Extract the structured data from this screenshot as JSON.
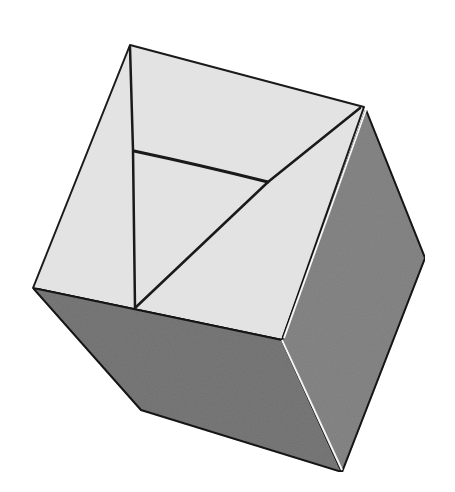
{
  "image": {
    "subject": "Hand-drawn shaded cube illustration",
    "caption": "Cube drawing",
    "colors": {
      "background": "#ffffff",
      "top_face": "#e4e4e4",
      "left_face": "#7d7d7d",
      "right_face": "#8a8a8a",
      "outline": "#1a1a1a"
    }
  }
}
